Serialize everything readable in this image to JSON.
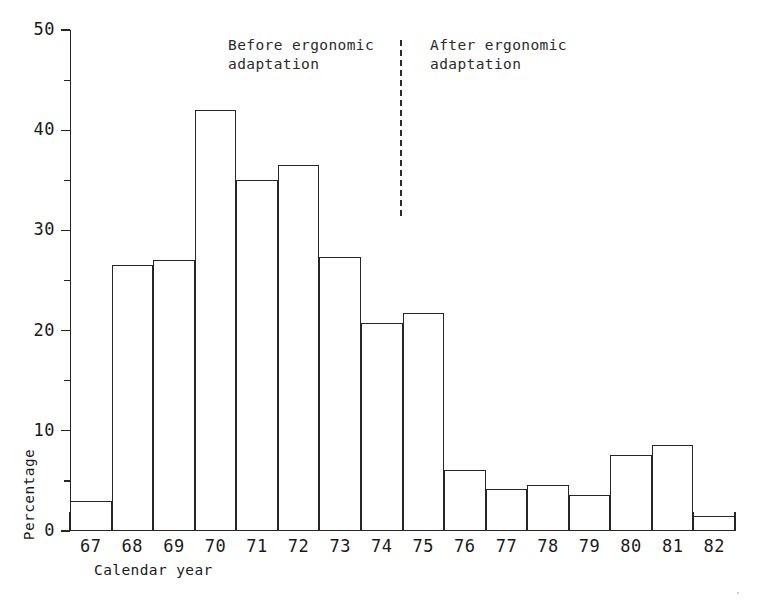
{
  "chart_data": {
    "type": "bar",
    "title": "",
    "subtitle": "",
    "xlabel": "Calendar year",
    "ylabel": "Percentage",
    "categories": [
      "67",
      "68",
      "69",
      "70",
      "71",
      "72",
      "73",
      "74",
      "75",
      "76",
      "77",
      "78",
      "79",
      "80",
      "81",
      "82"
    ],
    "values": [
      3.0,
      26.5,
      27.0,
      42.0,
      35.0,
      36.5,
      27.3,
      20.8,
      21.8,
      6.1,
      4.2,
      4.6,
      3.6,
      7.6,
      8.6,
      1.5
    ],
    "series": [
      {
        "name": "Percentage",
        "values": [
          3.0,
          26.5,
          27.0,
          42.0,
          35.0,
          36.5,
          27.3,
          20.8,
          21.8,
          6.1,
          4.2,
          4.6,
          3.6,
          7.6,
          8.6,
          1.5
        ]
      }
    ],
    "ylim": [
      0,
      50
    ],
    "xlim": [
      0,
      16
    ],
    "y_major_ticks": [
      0,
      10,
      20,
      30,
      40,
      50
    ],
    "y_minor_ticks": [
      5,
      15,
      25,
      35,
      45
    ],
    "y_tick_labels": [
      "0",
      "10",
      "20",
      "30",
      "40",
      "50"
    ],
    "grid": false,
    "legend": "none",
    "bar_style": "outlined",
    "bar_fill": "#ffffff",
    "bar_stroke": "#262626",
    "axis_color": "#262626",
    "annotations": [
      {
        "id": "before",
        "text": "Before ergonomic\nadaptation",
        "x_category_span": "67-74"
      },
      {
        "id": "after",
        "text": "After ergonomic\nadaptation",
        "x_category_span": "75-82"
      },
      {
        "id": "divider",
        "style": "dashed-vertical-line",
        "between": "74 and 75"
      }
    ]
  },
  "axes": {
    "y_title": "Percentage",
    "x_title": "Calendar year"
  },
  "annotations": {
    "before_label": "Before ergonomic\nadaptation",
    "after_label": "After ergonomic\nadaptation"
  },
  "colors": {
    "ink": "#262626",
    "background": "#ffffff"
  }
}
